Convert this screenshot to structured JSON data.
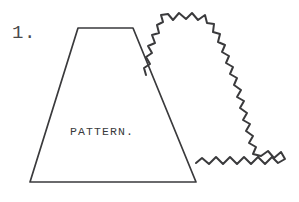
{
  "figure": {
    "background_color": "#ffffff",
    "ink_color": "#3a3a3c",
    "width": 299,
    "height": 202
  },
  "labels": {
    "step_number": "1.",
    "pattern_label": "PATTERN."
  },
  "shapes": {
    "trapezoid": {
      "name": "pattern-piece",
      "description": "Trapezoid pattern piece outline",
      "points": "78,28 133,28 196,182 30,182 78,28",
      "stroke_width": 1.7
    },
    "zigzag_fabric": {
      "name": "pinked-fabric-piece",
      "description": "Fabric piece with pinked zigzag edges",
      "path": "M 146,75 L 144,68 L 150,64 L 146,57 L 152,53 L 148,46 L 155,43 L 152,35 L 159,33 L 157,25 L 163,22 L 161,15 L 168,14 L 173,20 L 179,13 L 186,19 L 192,13 L 198,20 L 205,15 L 207,23 L 214,24 L 213,32 L 220,34 L 218,42 L 225,45 L 222,52 L 229,56 L 226,63 L 233,67 L 230,74 L 237,78 L 234,85 L 241,90 L 237,97 L 244,101 L 240,108 L 247,113 L 243,120 L 250,124 L 246,131 L 253,136 L 249,143 L 256,147 L 253,154 L 261,156 L 268,151 L 274,158 L 281,152 L 285,159 L 278,163 L 272,157 L 265,164 L 258,157 L 251,164 L 244,157 L 237,164 L 230,157 L 223,164 L 216,157 L 209,164 L 202,158 L 196,163",
      "stroke_width": 2.0,
      "teeth_top": 5,
      "teeth_bottom": 9
    }
  },
  "label_positions": {
    "step_number": {
      "x": 12,
      "y": 38
    },
    "pattern_label": {
      "x": 70,
      "y": 135
    }
  }
}
